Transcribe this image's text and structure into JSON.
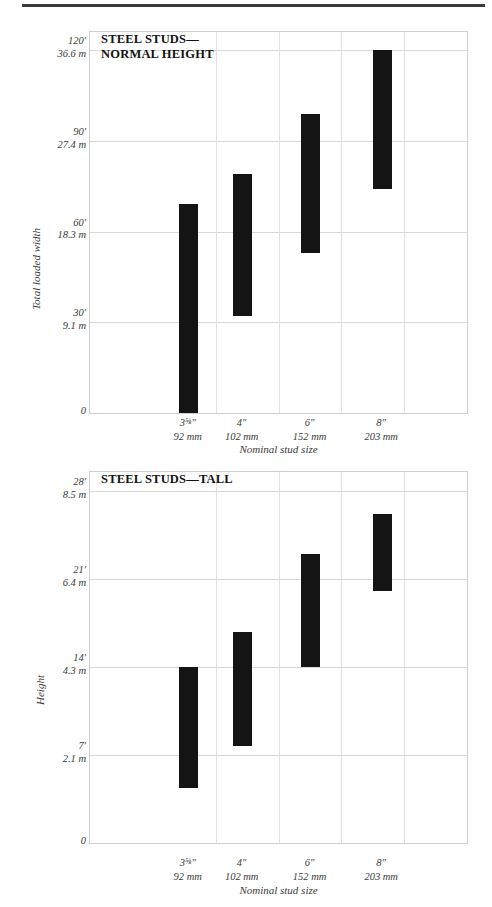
{
  "page": {
    "rule": "horizontal-rule"
  },
  "charts": [
    {
      "id": "steel-studs-normal-height",
      "title": "STEEL STUDS—\nNORMAL HEIGHT",
      "ylabel": "Total loaded width",
      "xlabel": "Nominal stud size",
      "yticks": [
        {
          "feet": "120'",
          "meters": "36.6 m",
          "value": 120
        },
        {
          "feet": "90'",
          "meters": "27.4 m",
          "value": 90
        },
        {
          "feet": "60'",
          "meters": "18.3 m",
          "value": 60
        },
        {
          "feet": "30'",
          "meters": "9.1 m",
          "value": 30
        },
        {
          "feet": "0",
          "meters": "",
          "value": 0
        }
      ],
      "xticks": [
        {
          "inches": "3⅝″",
          "mm": "92 mm"
        },
        {
          "inches": "4″",
          "mm": "102 mm"
        },
        {
          "inches": "6″",
          "mm": "152 mm"
        },
        {
          "inches": "8″",
          "mm": "203 mm"
        }
      ],
      "bar_color": "#141414"
    },
    {
      "id": "steel-studs-tall",
      "title": "STEEL STUDS—TALL",
      "ylabel": "Height",
      "xlabel": "Nominal stud size",
      "yticks": [
        {
          "feet": "28'",
          "meters": "8.5 m",
          "value": 28
        },
        {
          "feet": "21'",
          "meters": "6.4 m",
          "value": 21
        },
        {
          "feet": "14'",
          "meters": "4.3 m",
          "value": 14
        },
        {
          "feet": "7'",
          "meters": "2.1 m",
          "value": 7
        },
        {
          "feet": "0",
          "meters": "",
          "value": 0
        }
      ],
      "xticks": [
        {
          "inches": "3⅝″",
          "mm": "92 mm"
        },
        {
          "inches": "4″",
          "mm": "102 mm"
        },
        {
          "inches": "6″",
          "mm": "152 mm"
        },
        {
          "inches": "8″",
          "mm": "203 mm"
        }
      ],
      "bar_color": "#141414"
    }
  ],
  "chart_data": [
    {
      "type": "bar",
      "chart_id": "steel-studs-normal-height",
      "title": "STEEL STUDS—NORMAL HEIGHT",
      "xlabel": "Nominal stud size",
      "ylabel": "Total loaded width",
      "unit_primary": "ft",
      "unit_secondary": "m",
      "ylim": [
        0,
        126
      ],
      "ytick_values": [
        0,
        30,
        60,
        90,
        120
      ],
      "ytick_labels_ft": [
        "0",
        "30'",
        "60'",
        "90'",
        "120'"
      ],
      "ytick_labels_m": [
        "",
        "9.1 m",
        "18.3 m",
        "27.4 m",
        "36.6 m"
      ],
      "grid": true,
      "legend": "none",
      "categories": [
        "3⅝″",
        "4″",
        "6″",
        "8″"
      ],
      "categories_mm": [
        "92 mm",
        "102 mm",
        "152 mm",
        "203 mm"
      ],
      "series": [
        {
          "name": "Total loaded width range (ft)",
          "type": "range",
          "low": [
            0,
            32,
            53,
            74
          ],
          "high": [
            69,
            79,
            99,
            120
          ]
        }
      ]
    },
    {
      "type": "bar",
      "chart_id": "steel-studs-tall",
      "title": "STEEL STUDS—TALL",
      "xlabel": "Nominal stud size",
      "ylabel": "Height",
      "unit_primary": "ft",
      "unit_secondary": "m",
      "ylim": [
        0,
        29.5
      ],
      "ytick_values": [
        0,
        7,
        14,
        21,
        28
      ],
      "ytick_labels_ft": [
        "0",
        "7'",
        "14'",
        "21'",
        "28'"
      ],
      "ytick_labels_m": [
        "",
        "2.1 m",
        "4.3 m",
        "6.4 m",
        "8.5 m"
      ],
      "grid": true,
      "legend": "none",
      "categories": [
        "3⅝″",
        "4″",
        "6″",
        "8″"
      ],
      "categories_mm": [
        "92 mm",
        "102 mm",
        "152 mm",
        "203 mm"
      ],
      "series": [
        {
          "name": "Height range (ft)",
          "type": "range",
          "low": [
            4.4,
            7.7,
            14.0,
            20.0
          ],
          "high": [
            14.0,
            16.8,
            23.0,
            26.2
          ]
        }
      ]
    }
  ]
}
